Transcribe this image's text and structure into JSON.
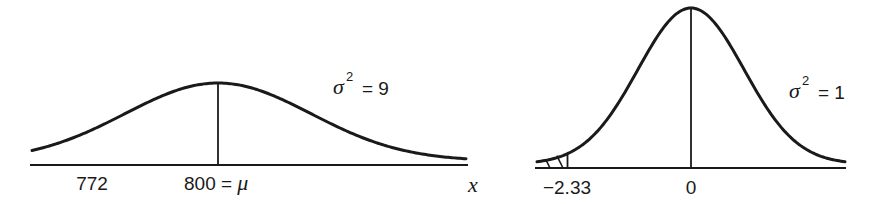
{
  "chart_data": [
    {
      "type": "line",
      "title": "Normal density, variance 9",
      "mean": 800,
      "variance": 9,
      "variance_label": "= 9",
      "sigma_symbol": "σ",
      "sup": "2",
      "xlabel": "x",
      "tick_labels": [
        {
          "value": 772,
          "text": "772"
        },
        {
          "value": 800,
          "text": "800 = μ"
        }
      ],
      "shaded_region": {
        "from": "-inf",
        "to": 772,
        "tail": "left"
      }
    },
    {
      "type": "line",
      "title": "Standard normal density, variance 1",
      "mean": 0,
      "variance": 1,
      "variance_label": "= 1",
      "sigma_symbol": "σ",
      "sup": "2",
      "xlabel": "",
      "tick_labels": [
        {
          "value": -2.33,
          "text": "−2.33"
        },
        {
          "value": 0,
          "text": "0"
        }
      ],
      "shaded_region": {
        "from": "-inf",
        "to": -2.33,
        "tail": "left"
      }
    }
  ]
}
